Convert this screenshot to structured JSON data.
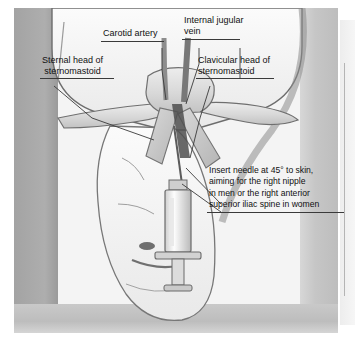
{
  "figure": {
    "style": "grayscale medical line illustration",
    "labels": [
      {
        "id": "carotid-artery",
        "text": "Carotid artery"
      },
      {
        "id": "internal-jugular-vein",
        "text": "Internal jugular\nvein"
      },
      {
        "id": "sternal-head",
        "text": "Sternal head of\nsternomastoid"
      },
      {
        "id": "clavicular-head",
        "text": "Clavicular head of\nsternomastoid"
      }
    ],
    "instruction": {
      "id": "needle-instruction",
      "text": "Insert needle at 45° to skin, aiming for the right nipple in men or the right anterior superior iliac spine in women",
      "lines": [
        "Insert needle at 45° to skin,",
        "aiming for the right nipple",
        "in men or the right anterior",
        "superior iliac spine in women"
      ]
    },
    "anatomy": [
      {
        "id": "clavicle-left",
        "name": "clavicle"
      },
      {
        "id": "clavicle-right",
        "name": "clavicle"
      },
      {
        "id": "manubrium",
        "name": "manubrium of sternum"
      },
      {
        "id": "sternomastoid-muscle",
        "name": "sternomastoid muscle"
      },
      {
        "id": "patient-head",
        "name": "patient head turned away"
      },
      {
        "id": "syringe",
        "name": "syringe with needle"
      }
    ],
    "colors": {
      "plate_background": "#f4f4f4",
      "surround_gray": "#a9a9a9",
      "shadow_gray": "#bdbdbd",
      "skin_fill": "#f0f0f0",
      "bone_fill": "#dcdcdc",
      "muscle_fill": "#c8c8c8",
      "line_stroke": "#4a4a4a",
      "label_text": "#111111",
      "page_strip": "#ededed"
    }
  }
}
